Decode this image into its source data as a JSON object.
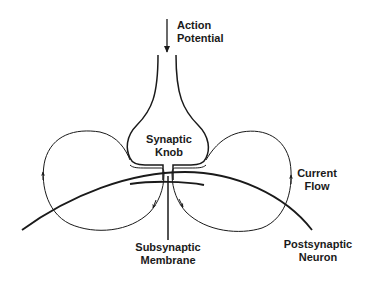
{
  "diagram": {
    "line_color": "#1a1a1a",
    "background": "#ffffff",
    "labels": {
      "action_potential": {
        "line1": "Action",
        "line2": "Potential"
      },
      "synaptic_knob": {
        "line1": "Synaptic",
        "line2": "Knob"
      },
      "current_flow": {
        "line1": "Current",
        "line2": "Flow"
      },
      "subsynaptic_membrane": {
        "line1": "Subsynaptic",
        "line2": "Membrane"
      },
      "postsynaptic_neuron": {
        "line1": "Postsynaptic",
        "line2": "Neuron"
      }
    },
    "elements": [
      "action-potential-arrow",
      "synaptic-knob-outline",
      "postsynaptic-neuron-membrane",
      "subsynaptic-membrane",
      "left-current-flow-loop",
      "right-current-flow-loop",
      "subsynaptic-label-leader-line"
    ]
  }
}
